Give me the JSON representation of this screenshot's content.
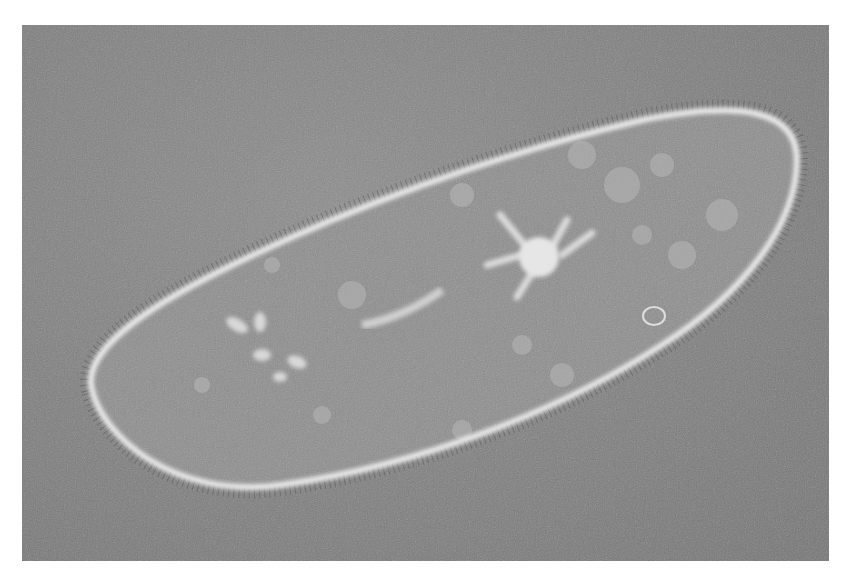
{
  "image": {
    "subject": "Paramecium cell under phase-contrast microscope",
    "background_color": "#7f7f7f",
    "cell_outline_color": "#e8e8e8",
    "cell_fill_color": "#8a8a8a",
    "features": [
      "cilia",
      "contractile-vacuole",
      "oral-groove",
      "food-vacuoles"
    ]
  }
}
